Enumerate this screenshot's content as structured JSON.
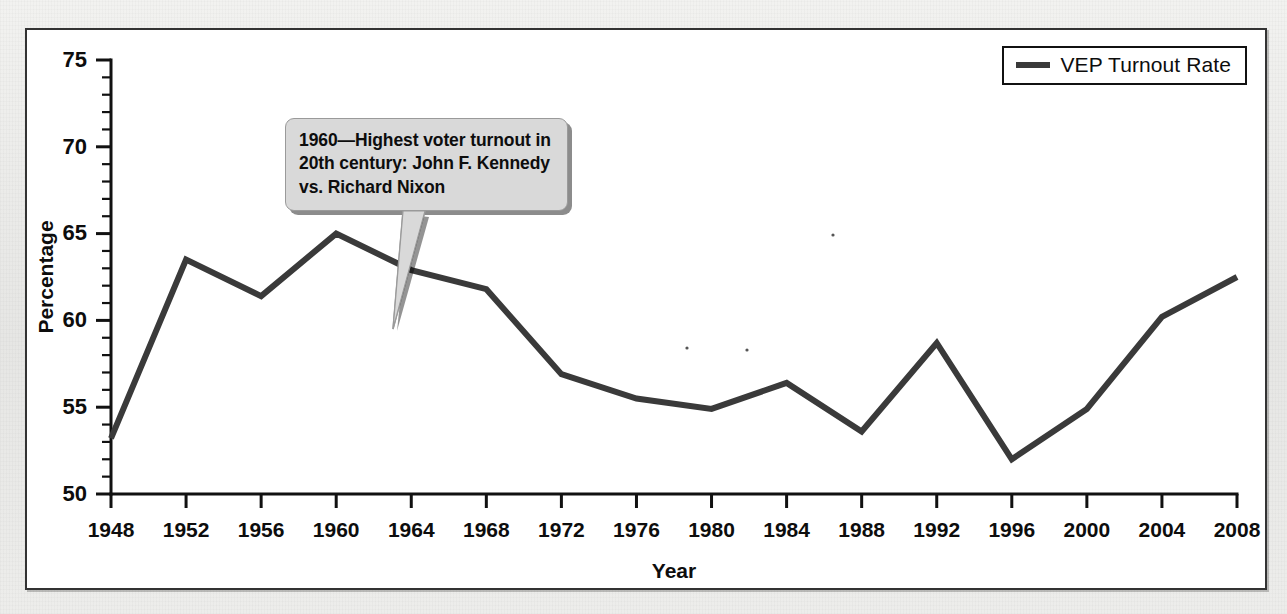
{
  "figure": {
    "background_color": "#ffffff",
    "frame_color": "#333333",
    "page_background": "#ebebeb"
  },
  "legend": {
    "label": "VEP Turnout Rate",
    "swatch_color": "#3a3a3a",
    "position": "top-right"
  },
  "annotation": {
    "text": "1960—Highest voter turnout in 20th century: John F. Kennedy vs. Richard Nixon",
    "target_year": 1960,
    "target_value": 65.0,
    "bubble_color": "#d9d9d9",
    "text_color": "#0d0d0d"
  },
  "chart_data": {
    "type": "line",
    "title": "",
    "subtitle": "",
    "xlabel": "Year",
    "ylabel": "Percentage",
    "xlim": [
      1948,
      2008
    ],
    "ylim": [
      50,
      75
    ],
    "grid": false,
    "legend_position": "top-right",
    "y_major_ticks": [
      50,
      55,
      60,
      65,
      70,
      75
    ],
    "y_minor_tick_step": 1,
    "y_tick_labels": [
      "50",
      "55",
      "60",
      "65",
      "70",
      "75"
    ],
    "x": [
      1948,
      1952,
      1956,
      1960,
      1964,
      1968,
      1972,
      1976,
      1980,
      1984,
      1988,
      1992,
      1996,
      2000,
      2004,
      2008
    ],
    "x_tick_labels": [
      "1948",
      "1952",
      "1956",
      "1960",
      "1964",
      "1968",
      "1972",
      "1976",
      "1980",
      "1984",
      "1988",
      "1992",
      "1996",
      "2000",
      "2004",
      "2008"
    ],
    "series": [
      {
        "name": "VEP Turnout Rate",
        "color": "#3a3a3a",
        "line_width": 6,
        "values": [
          53.2,
          63.5,
          61.4,
          65.0,
          62.9,
          61.8,
          56.9,
          55.5,
          54.9,
          56.4,
          53.6,
          58.7,
          52.0,
          54.9,
          60.2,
          62.5
        ]
      }
    ],
    "annotations": [
      {
        "x": 1960,
        "y": 65.0,
        "text": "1960—Highest voter turnout in 20th century: John F. Kennedy vs. Richard Nixon"
      }
    ]
  }
}
